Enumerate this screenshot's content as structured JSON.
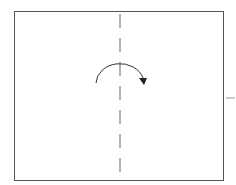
{
  "diagram": {
    "type": "origami-fold-instruction",
    "paper": {
      "x": 14,
      "y": 11,
      "width": 210,
      "height": 170,
      "stroke": "#555555",
      "fill": "#ffffff"
    },
    "fold_line": {
      "style": "dashed",
      "x": 120,
      "y1": 14,
      "y2": 176,
      "stroke": "#666666"
    },
    "arrow": {
      "direction": "left-to-right",
      "shape": "arc",
      "stroke": "#333333"
    },
    "side_mark": {
      "x": 226,
      "y": 98,
      "color": "#cccccc"
    }
  }
}
